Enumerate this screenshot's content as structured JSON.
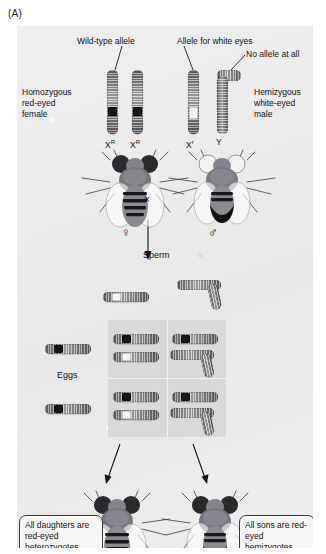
{
  "figure": {
    "panel_label": "(A)",
    "organism": "Drosophila",
    "caption_topic": "X-linked inheritance of white eye color"
  },
  "parents": {
    "female": {
      "label_lines": [
        "Homozygous",
        "red-eyed",
        "female"
      ],
      "genotype_left": "X",
      "genotype_left_sup": "R",
      "genotype_right": "X",
      "genotype_right_sup": "R",
      "sex_symbol": "♀",
      "allele_callout": "Wild-type allele"
    },
    "male": {
      "label_lines": [
        "Hemizygous",
        "white-eyed",
        "male"
      ],
      "genotype_left": "X",
      "genotype_left_sup": "r",
      "genotype_right": "Y",
      "genotype_right_sup": "",
      "sex_symbol": "♂",
      "allele_callout": "Allele for white eyes",
      "y_callout": "No allele at all"
    },
    "cross_symbol": "×"
  },
  "punnett": {
    "column_header": "Sperm",
    "row_header": "Eggs",
    "sperm_gametes": [
      {
        "name": "X-white",
        "type": "X",
        "allele": "light"
      },
      {
        "name": "Y",
        "type": "Y",
        "allele": "none"
      }
    ],
    "egg_gametes": [
      {
        "name": "X-red",
        "type": "X",
        "allele": "dark"
      },
      {
        "name": "X-red",
        "type": "X",
        "allele": "dark"
      }
    ],
    "cells": [
      {
        "row": 0,
        "col": 0,
        "genotype": "X(R) X(r)",
        "offspring": "daughter"
      },
      {
        "row": 0,
        "col": 1,
        "genotype": "X(R) Y",
        "offspring": "son"
      },
      {
        "row": 1,
        "col": 0,
        "genotype": "X(R) X(r)",
        "offspring": "daughter"
      },
      {
        "row": 1,
        "col": 1,
        "genotype": "X(R) Y",
        "offspring": "son"
      }
    ]
  },
  "offspring": {
    "daughters_callout": "All daughters are red-eyed heterozygotes.",
    "sons_callout": "All sons are red-eyed hemizygotes."
  },
  "colors": {
    "panel_bg": "#ececed",
    "grid_bg": "#d9d9da",
    "grid_line": "#f3f3f3",
    "ink": "#111111",
    "allele_dominant": "#17171a",
    "allele_recessive": "#f4f4f2",
    "callout_bg": "#f7f7f6",
    "callout_border": "#3a3a3a"
  }
}
